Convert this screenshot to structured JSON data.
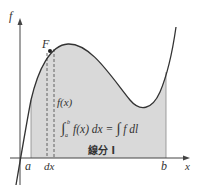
{
  "diagram": {
    "labels": {
      "y_axis": "f",
      "x_axis": "x",
      "point": "F",
      "a": "a",
      "b": "b",
      "dx": "dx",
      "fx": "f(x)",
      "formula": "∫ f(x) dx = ∫ f dl",
      "formula_lower": "a",
      "formula_upper": "b",
      "segment": "線分 l"
    },
    "colors": {
      "fill": "#d9d9d9",
      "curve": "#333333",
      "axis": "#444444",
      "background": "#ffffff"
    }
  }
}
